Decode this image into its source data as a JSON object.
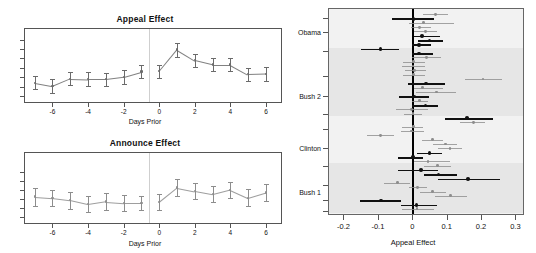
{
  "panels": {
    "appeal": {
      "title": "Appeal Effect",
      "xlabel": "Days Prior"
    },
    "announce": {
      "title": "Announce Effect",
      "xlabel": "Days Prior"
    },
    "forest": {
      "xlabel": "Appeal Effect"
    }
  },
  "chart_data": [
    {
      "type": "line",
      "id": "appeal-effect",
      "title": "Appeal Effect",
      "xlabel": "Days Prior",
      "ylabel": "",
      "xlim": [
        -7.6,
        6.9
      ],
      "ylim": [
        -0.055,
        0.105
      ],
      "xticks": [
        -6,
        -4,
        -2,
        0,
        2,
        4,
        6
      ],
      "xticklabels": [
        "-6",
        "-4",
        "-2",
        "0",
        "2",
        "4",
        "6"
      ],
      "yticks": [
        -0.04,
        -0.02,
        0.0,
        0.02,
        0.04,
        0.06,
        0.08
      ],
      "yticklabels": [
        "",
        "",
        "",
        "",
        "",
        "",
        ""
      ],
      "grid": false,
      "legend": null,
      "vline_at": -0.6,
      "series": [
        {
          "name": "pre-period",
          "color": "#6b6b6b",
          "x": [
            -7,
            -6,
            -5,
            -4,
            -3,
            -2,
            -1
          ],
          "y": [
            -0.012,
            -0.019,
            -0.003,
            -0.004,
            -0.004,
            0.001,
            0.012
          ],
          "ylo": [
            -0.026,
            -0.034,
            -0.017,
            -0.019,
            -0.018,
            -0.014,
            -0.002
          ],
          "yhi": [
            0.002,
            -0.004,
            0.011,
            0.011,
            0.01,
            0.016,
            0.026
          ]
        },
        {
          "name": "post-period",
          "color": "#6b6b6b",
          "x": [
            0,
            1,
            2,
            3,
            4,
            5,
            6
          ],
          "y": [
            0.013,
            0.059,
            0.036,
            0.027,
            0.027,
            0.006,
            0.007
          ],
          "ylo": [
            -0.001,
            0.044,
            0.022,
            0.013,
            0.013,
            -0.008,
            -0.007
          ],
          "yhi": [
            0.027,
            0.074,
            0.05,
            0.041,
            0.041,
            0.02,
            0.021
          ]
        }
      ]
    },
    {
      "type": "line",
      "id": "announce-effect",
      "title": "Announce Effect",
      "xlabel": "Days Prior",
      "ylabel": "",
      "xlim": [
        -7.6,
        6.9
      ],
      "ylim": [
        -0.055,
        0.105
      ],
      "xticks": [
        -6,
        -4,
        -2,
        0,
        2,
        4,
        6
      ],
      "xticklabels": [
        "-6",
        "-4",
        "-2",
        "0",
        "2",
        "4",
        "6"
      ],
      "yticks": [
        -0.04,
        -0.02,
        0.0,
        0.02,
        0.04,
        0.06
      ],
      "yticklabels": [
        "",
        "",
        "",
        "",
        "",
        ""
      ],
      "grid": false,
      "legend": null,
      "vline_at": -0.6,
      "series": [
        {
          "name": "pre-period",
          "color": "#8d8d8d",
          "x": [
            -7,
            -6,
            -5,
            -4,
            -3,
            -2,
            -1
          ],
          "y": [
            0.006,
            0.003,
            -0.002,
            -0.011,
            -0.005,
            -0.008,
            -0.008
          ],
          "ylo": [
            -0.014,
            -0.015,
            -0.021,
            -0.029,
            -0.023,
            -0.026,
            -0.024
          ],
          "yhi": [
            0.026,
            0.021,
            0.017,
            0.007,
            0.013,
            0.01,
            0.008
          ]
        },
        {
          "name": "post-period",
          "color": "#8d8d8d",
          "x": [
            0,
            1,
            2,
            3,
            4,
            5,
            6
          ],
          "y": [
            -0.006,
            0.026,
            0.018,
            0.011,
            0.021,
            0.003,
            0.015
          ],
          "ylo": [
            -0.024,
            0.008,
            0.0,
            -0.007,
            0.003,
            -0.016,
            -0.004
          ],
          "yhi": [
            0.012,
            0.044,
            0.036,
            0.029,
            0.039,
            0.022,
            0.034
          ]
        }
      ]
    },
    {
      "type": "scatter",
      "id": "appeal-effect-forest",
      "title": "",
      "xlabel": "Appeal Effect",
      "ylabel": "",
      "xlim": [
        -0.245,
        0.325
      ],
      "xticks": [
        -0.2,
        -0.1,
        0.0,
        0.1,
        0.2,
        0.3
      ],
      "xticklabels": [
        "-0.2",
        "-0.1",
        "0",
        "0.1",
        "0.2",
        "0.3"
      ],
      "group_labels": [
        "Obama",
        "Bush 2",
        "Clinton",
        "Bush 1"
      ],
      "zero_reference_line": 0,
      "grid": false,
      "legend": null,
      "points": [
        {
          "row": 0,
          "est": 0.068,
          "lo": 0.032,
          "hi": 0.104,
          "color": "#8d8d8d"
        },
        {
          "row": 1,
          "est": 0.004,
          "lo": -0.058,
          "hi": 0.064,
          "color": "#111111"
        },
        {
          "row": 2,
          "est": 0.033,
          "lo": -0.01,
          "hi": 0.122,
          "color": "#8d8d8d"
        },
        {
          "row": 3,
          "est": 0.022,
          "lo": -0.004,
          "hi": 0.055,
          "color": "#8d8d8d"
        },
        {
          "row": 4,
          "est": 0.038,
          "lo": 0.006,
          "hi": 0.072,
          "color": "#8d8d8d"
        },
        {
          "row": 5,
          "est": 0.028,
          "lo": 0.004,
          "hi": 0.082,
          "color": "#111111"
        },
        {
          "row": 6,
          "est": 0.05,
          "lo": 0.016,
          "hi": 0.09,
          "color": "#111111"
        },
        {
          "row": 7,
          "est": 0.02,
          "lo": -0.002,
          "hi": 0.056,
          "color": "#111111"
        },
        {
          "row": 8,
          "est": -0.092,
          "lo": -0.15,
          "hi": -0.038,
          "color": "#111111"
        },
        {
          "row": 9,
          "est": 0.02,
          "lo": 0.0,
          "hi": 0.06,
          "color": "#111111"
        },
        {
          "row": 10,
          "est": 0.042,
          "lo": 0.0,
          "hi": 0.084,
          "color": "#8d8d8d"
        },
        {
          "row": 11,
          "est": 0.004,
          "lo": -0.028,
          "hi": 0.036,
          "color": "#8d8d8d"
        },
        {
          "row": 12,
          "est": 0.002,
          "lo": -0.03,
          "hi": 0.036,
          "color": "#8d8d8d"
        },
        {
          "row": 13,
          "est": 0.006,
          "lo": -0.02,
          "hi": 0.04,
          "color": "#8d8d8d"
        },
        {
          "row": 14,
          "est": 0.004,
          "lo": -0.026,
          "hi": 0.036,
          "color": "#8d8d8d"
        },
        {
          "row": 15,
          "est": 0.206,
          "lo": 0.152,
          "hi": 0.262,
          "color": "#8d8d8d"
        },
        {
          "row": 16,
          "est": 0.04,
          "lo": -0.012,
          "hi": 0.094,
          "color": "#111111"
        },
        {
          "row": 17,
          "est": 0.03,
          "lo": 0.004,
          "hi": 0.09,
          "color": "#8d8d8d"
        },
        {
          "row": 18,
          "est": 0.07,
          "lo": 0.012,
          "hi": 0.126,
          "color": "#8d8d8d"
        },
        {
          "row": 19,
          "est": 0.006,
          "lo": -0.038,
          "hi": 0.05,
          "color": "#111111"
        },
        {
          "row": 20,
          "est": 0.022,
          "lo": -0.002,
          "hi": 0.046,
          "color": "#8d8d8d"
        },
        {
          "row": 21,
          "est": 0.038,
          "lo": -0.002,
          "hi": 0.076,
          "color": "#111111"
        },
        {
          "row": 22,
          "est": -0.002,
          "lo": -0.048,
          "hi": 0.046,
          "color": "#8d8d8d"
        },
        {
          "row": 23,
          "est": 0.002,
          "lo": -0.024,
          "hi": 0.028,
          "color": "#8d8d8d"
        },
        {
          "row": 24,
          "est": 0.16,
          "lo": 0.096,
          "hi": 0.234,
          "color": "#111111"
        },
        {
          "row": 25,
          "est": 0.178,
          "lo": 0.14,
          "hi": 0.212,
          "color": "#8d8d8d"
        },
        {
          "row": 26,
          "est": 0.004,
          "lo": -0.03,
          "hi": 0.03,
          "color": "#8d8d8d"
        },
        {
          "row": 27,
          "est": -0.002,
          "lo": -0.034,
          "hi": 0.034,
          "color": "#8d8d8d"
        },
        {
          "row": 28,
          "est": -0.092,
          "lo": -0.132,
          "hi": -0.052,
          "color": "#8d8d8d"
        },
        {
          "row": 29,
          "est": 0.06,
          "lo": 0.028,
          "hi": 0.09,
          "color": "#8d8d8d"
        },
        {
          "row": 30,
          "est": 0.096,
          "lo": 0.06,
          "hi": 0.13,
          "color": "#8d8d8d"
        },
        {
          "row": 31,
          "est": 0.11,
          "lo": 0.074,
          "hi": 0.146,
          "color": "#8d8d8d"
        },
        {
          "row": 32,
          "est": 0.05,
          "lo": 0.014,
          "hi": 0.088,
          "color": "#111111"
        },
        {
          "row": 33,
          "est": 0.002,
          "lo": -0.04,
          "hi": 0.03,
          "color": "#111111"
        },
        {
          "row": 34,
          "est": 0.046,
          "lo": 0.006,
          "hi": 0.11,
          "color": "#8d8d8d"
        },
        {
          "row": 35,
          "est": 0.074,
          "lo": 0.034,
          "hi": 0.114,
          "color": "#8d8d8d"
        },
        {
          "row": 36,
          "est": 0.026,
          "lo": -0.042,
          "hi": 0.076,
          "color": "#111111"
        },
        {
          "row": 37,
          "est": 0.076,
          "lo": 0.034,
          "hi": 0.13,
          "color": "#111111"
        },
        {
          "row": 38,
          "est": 0.162,
          "lo": 0.074,
          "hi": 0.256,
          "color": "#111111"
        },
        {
          "row": 39,
          "est": -0.044,
          "lo": -0.082,
          "hi": -0.006,
          "color": "#8d8d8d"
        },
        {
          "row": 40,
          "est": 0.016,
          "lo": -0.01,
          "hi": 0.042,
          "color": "#8d8d8d"
        },
        {
          "row": 41,
          "est": 0.06,
          "lo": 0.022,
          "hi": 0.098,
          "color": "#8d8d8d"
        },
        {
          "row": 42,
          "est": 0.112,
          "lo": 0.066,
          "hi": 0.158,
          "color": "#8d8d8d"
        },
        {
          "row": 43,
          "est": -0.09,
          "lo": -0.152,
          "hi": -0.032,
          "color": "#111111"
        },
        {
          "row": 44,
          "est": 0.012,
          "lo": -0.034,
          "hi": 0.072,
          "color": "#111111"
        },
        {
          "row": 45,
          "est": 0.014,
          "lo": -0.03,
          "hi": 0.062,
          "color": "#8d8d8d"
        }
      ],
      "group_tick_rows": [
        1.0,
        4.2,
        8.4,
        14.2,
        19.0,
        23.0,
        26.6,
        31.0,
        35.0,
        39.5,
        43.0,
        45.5
      ],
      "group_label_rows": [
        4.2,
        19.0,
        31.0,
        41.0
      ],
      "shaded_bands": [
        [
          8.4,
          23.0
        ],
        [
          35.0,
          45.5
        ]
      ]
    }
  ]
}
